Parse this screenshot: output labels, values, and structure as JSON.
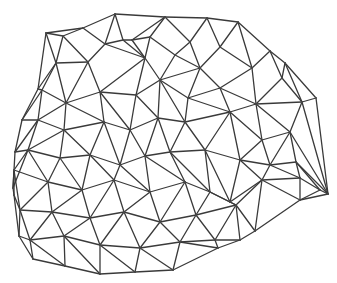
{
  "diagram": {
    "type": "triangulated-irregular-network",
    "width": 337,
    "height": 283,
    "stroke_color": "#3a3a3a",
    "background": "#ffffff",
    "vertices": [
      [
        46,
        33
      ],
      [
        83,
        28
      ],
      [
        115,
        14
      ],
      [
        165,
        17
      ],
      [
        207,
        18
      ],
      [
        238,
        22
      ],
      [
        270,
        51
      ],
      [
        285,
        63
      ],
      [
        316,
        98
      ],
      [
        328,
        194
      ],
      [
        300,
        200
      ],
      [
        255,
        231
      ],
      [
        240,
        240
      ],
      [
        218,
        248
      ],
      [
        173,
        270
      ],
      [
        135,
        272
      ],
      [
        100,
        274
      ],
      [
        65,
        266
      ],
      [
        33,
        259
      ],
      [
        19,
        236
      ],
      [
        14,
        195
      ],
      [
        13,
        188
      ],
      [
        15,
        152
      ],
      [
        22,
        120
      ],
      [
        38,
        89
      ],
      [
        63,
        36
      ],
      [
        105,
        44
      ],
      [
        132,
        40
      ],
      [
        150,
        37
      ],
      [
        190,
        42
      ],
      [
        220,
        47
      ],
      [
        56,
        63
      ],
      [
        88,
        62
      ],
      [
        123,
        40
      ],
      [
        145,
        58
      ],
      [
        175,
        55
      ],
      [
        200,
        68
      ],
      [
        252,
        68
      ],
      [
        282,
        78
      ],
      [
        42,
        90
      ],
      [
        66,
        103
      ],
      [
        100,
        92
      ],
      [
        136,
        95
      ],
      [
        160,
        80
      ],
      [
        188,
        98
      ],
      [
        220,
        88
      ],
      [
        256,
        104
      ],
      [
        302,
        102
      ],
      [
        38,
        120
      ],
      [
        64,
        130
      ],
      [
        104,
        122
      ],
      [
        130,
        130
      ],
      [
        158,
        118
      ],
      [
        185,
        122
      ],
      [
        230,
        112
      ],
      [
        262,
        140
      ],
      [
        290,
        132
      ],
      [
        28,
        150
      ],
      [
        60,
        158
      ],
      [
        90,
        155
      ],
      [
        120,
        165
      ],
      [
        145,
        156
      ],
      [
        170,
        152
      ],
      [
        205,
        150
      ],
      [
        240,
        160
      ],
      [
        270,
        165
      ],
      [
        296,
        162
      ],
      [
        14,
        170
      ],
      [
        48,
        182
      ],
      [
        82,
        190
      ],
      [
        114,
        180
      ],
      [
        150,
        192
      ],
      [
        185,
        182
      ],
      [
        210,
        192
      ],
      [
        230,
        202
      ],
      [
        262,
        180
      ],
      [
        300,
        178
      ],
      [
        320,
        190
      ],
      [
        20,
        210
      ],
      [
        52,
        212
      ],
      [
        90,
        218
      ],
      [
        124,
        212
      ],
      [
        160,
        222
      ],
      [
        196,
        215
      ],
      [
        236,
        205
      ],
      [
        30,
        240
      ],
      [
        64,
        236
      ],
      [
        100,
        245
      ],
      [
        140,
        248
      ],
      [
        180,
        242
      ],
      [
        215,
        240
      ]
    ],
    "edges": [
      [
        0,
        1
      ],
      [
        1,
        2
      ],
      [
        2,
        3
      ],
      [
        3,
        4
      ],
      [
        4,
        5
      ],
      [
        5,
        6
      ],
      [
        6,
        7
      ],
      [
        7,
        8
      ],
      [
        8,
        9
      ],
      [
        9,
        10
      ],
      [
        10,
        11
      ],
      [
        11,
        12
      ],
      [
        12,
        13
      ],
      [
        13,
        14
      ],
      [
        14,
        15
      ],
      [
        15,
        16
      ],
      [
        16,
        17
      ],
      [
        17,
        18
      ],
      [
        18,
        19
      ],
      [
        19,
        20
      ],
      [
        20,
        21
      ],
      [
        21,
        22
      ],
      [
        22,
        23
      ],
      [
        23,
        24
      ],
      [
        24,
        0
      ],
      [
        0,
        25
      ],
      [
        25,
        1
      ],
      [
        1,
        26
      ],
      [
        26,
        2
      ],
      [
        2,
        33
      ],
      [
        33,
        27
      ],
      [
        27,
        3
      ],
      [
        3,
        28
      ],
      [
        28,
        27
      ],
      [
        3,
        29
      ],
      [
        29,
        4
      ],
      [
        4,
        30
      ],
      [
        30,
        5
      ],
      [
        0,
        31
      ],
      [
        25,
        31
      ],
      [
        31,
        32
      ],
      [
        25,
        32
      ],
      [
        32,
        26
      ],
      [
        26,
        33
      ],
      [
        33,
        34
      ],
      [
        26,
        34
      ],
      [
        34,
        27
      ],
      [
        34,
        28
      ],
      [
        28,
        35
      ],
      [
        35,
        29
      ],
      [
        29,
        36
      ],
      [
        36,
        30
      ],
      [
        30,
        37
      ],
      [
        37,
        5
      ],
      [
        37,
        6
      ],
      [
        6,
        38
      ],
      [
        38,
        7
      ],
      [
        24,
        31
      ],
      [
        24,
        39
      ],
      [
        31,
        39
      ],
      [
        39,
        40
      ],
      [
        31,
        40
      ],
      [
        40,
        32
      ],
      [
        32,
        41
      ],
      [
        40,
        41
      ],
      [
        41,
        34
      ],
      [
        41,
        42
      ],
      [
        34,
        42
      ],
      [
        42,
        43
      ],
      [
        34,
        43
      ],
      [
        43,
        35
      ],
      [
        35,
        36
      ],
      [
        43,
        36
      ],
      [
        43,
        44
      ],
      [
        36,
        44
      ],
      [
        44,
        45
      ],
      [
        36,
        45
      ],
      [
        45,
        37
      ],
      [
        45,
        46
      ],
      [
        37,
        46
      ],
      [
        46,
        38
      ],
      [
        38,
        47
      ],
      [
        46,
        47
      ],
      [
        7,
        47
      ],
      [
        47,
        8
      ],
      [
        23,
        39
      ],
      [
        23,
        48
      ],
      [
        39,
        48
      ],
      [
        48,
        40
      ],
      [
        40,
        49
      ],
      [
        48,
        49
      ],
      [
        49,
        50
      ],
      [
        40,
        50
      ],
      [
        50,
        41
      ],
      [
        50,
        51
      ],
      [
        41,
        51
      ],
      [
        51,
        42
      ],
      [
        51,
        52
      ],
      [
        42,
        52
      ],
      [
        52,
        43
      ],
      [
        52,
        53
      ],
      [
        43,
        53
      ],
      [
        53,
        44
      ],
      [
        53,
        54
      ],
      [
        44,
        54
      ],
      [
        54,
        45
      ],
      [
        54,
        46
      ],
      [
        54,
        55
      ],
      [
        46,
        55
      ],
      [
        55,
        56
      ],
      [
        46,
        56
      ],
      [
        56,
        47
      ],
      [
        47,
        9
      ],
      [
        56,
        9
      ],
      [
        22,
        48
      ],
      [
        22,
        57
      ],
      [
        48,
        57
      ],
      [
        57,
        49
      ],
      [
        49,
        58
      ],
      [
        57,
        58
      ],
      [
        58,
        59
      ],
      [
        49,
        59
      ],
      [
        59,
        50
      ],
      [
        59,
        60
      ],
      [
        50,
        60
      ],
      [
        60,
        51
      ],
      [
        60,
        61
      ],
      [
        51,
        61
      ],
      [
        61,
        52
      ],
      [
        61,
        62
      ],
      [
        52,
        62
      ],
      [
        62,
        53
      ],
      [
        62,
        63
      ],
      [
        53,
        63
      ],
      [
        63,
        54
      ],
      [
        63,
        64
      ],
      [
        54,
        64
      ],
      [
        64,
        55
      ],
      [
        64,
        65
      ],
      [
        55,
        65
      ],
      [
        65,
        56
      ],
      [
        65,
        66
      ],
      [
        56,
        66
      ],
      [
        66,
        9
      ],
      [
        21,
        57
      ],
      [
        21,
        67
      ],
      [
        57,
        67
      ],
      [
        67,
        68
      ],
      [
        57,
        68
      ],
      [
        68,
        58
      ],
      [
        58,
        69
      ],
      [
        68,
        69
      ],
      [
        69,
        59
      ],
      [
        69,
        70
      ],
      [
        59,
        70
      ],
      [
        70,
        60
      ],
      [
        70,
        71
      ],
      [
        60,
        71
      ],
      [
        71,
        61
      ],
      [
        71,
        72
      ],
      [
        61,
        72
      ],
      [
        72,
        62
      ],
      [
        72,
        73
      ],
      [
        62,
        73
      ],
      [
        73,
        63
      ],
      [
        73,
        74
      ],
      [
        63,
        74
      ],
      [
        74,
        64
      ],
      [
        74,
        75
      ],
      [
        64,
        75
      ],
      [
        75,
        65
      ],
      [
        75,
        76
      ],
      [
        65,
        76
      ],
      [
        76,
        66
      ],
      [
        76,
        77
      ],
      [
        66,
        77
      ],
      [
        77,
        9
      ],
      [
        77,
        10
      ],
      [
        76,
        10
      ],
      [
        20,
        67
      ],
      [
        20,
        78
      ],
      [
        67,
        78
      ],
      [
        78,
        68
      ],
      [
        68,
        79
      ],
      [
        78,
        79
      ],
      [
        79,
        69
      ],
      [
        79,
        80
      ],
      [
        69,
        80
      ],
      [
        80,
        70
      ],
      [
        80,
        81
      ],
      [
        70,
        81
      ],
      [
        81,
        71
      ],
      [
        81,
        82
      ],
      [
        71,
        82
      ],
      [
        82,
        72
      ],
      [
        82,
        83
      ],
      [
        72,
        83
      ],
      [
        83,
        73
      ],
      [
        83,
        84
      ],
      [
        73,
        84
      ],
      [
        84,
        74
      ],
      [
        84,
        75
      ],
      [
        84,
        11
      ],
      [
        75,
        11
      ],
      [
        75,
        10
      ],
      [
        19,
        78
      ],
      [
        19,
        85
      ],
      [
        78,
        85
      ],
      [
        85,
        79
      ],
      [
        85,
        86
      ],
      [
        79,
        86
      ],
      [
        86,
        80
      ],
      [
        86,
        87
      ],
      [
        80,
        87
      ],
      [
        87,
        81
      ],
      [
        87,
        88
      ],
      [
        81,
        88
      ],
      [
        88,
        82
      ],
      [
        88,
        89
      ],
      [
        82,
        89
      ],
      [
        89,
        83
      ],
      [
        89,
        90
      ],
      [
        83,
        90
      ],
      [
        90,
        84
      ],
      [
        90,
        12
      ],
      [
        84,
        12
      ],
      [
        18,
        85
      ],
      [
        85,
        17
      ],
      [
        86,
        17
      ],
      [
        86,
        16
      ],
      [
        87,
        16
      ],
      [
        87,
        15
      ],
      [
        88,
        15
      ],
      [
        88,
        14
      ],
      [
        89,
        14
      ],
      [
        89,
        13
      ],
      [
        90,
        13
      ]
    ]
  }
}
